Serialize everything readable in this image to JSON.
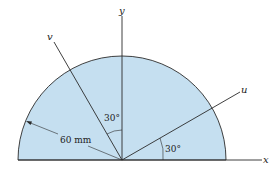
{
  "diagram": {
    "shape": "semicircle",
    "fill_color": "#c5dff0",
    "stroke_color": "#2a2a2a",
    "radius_label": "60 mm",
    "axes": {
      "x": "x",
      "y": "y",
      "u": "u",
      "v": "v"
    },
    "angles": {
      "v_from_y": "30°",
      "u_from_x": "30°"
    }
  }
}
